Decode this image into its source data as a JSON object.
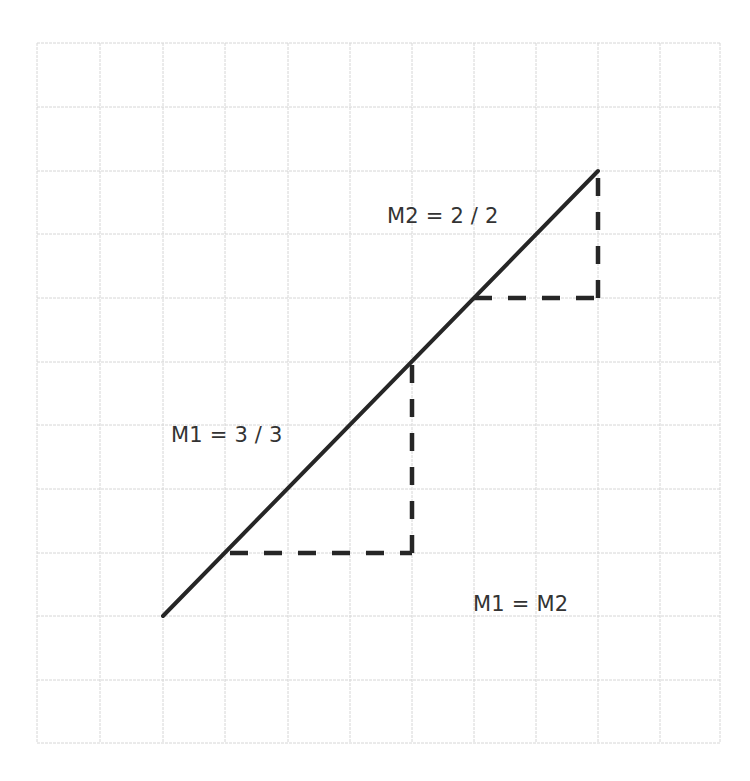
{
  "diagram": {
    "grid": {
      "columns": 11,
      "rows": 11,
      "x_lines": [
        37,
        100,
        163,
        225,
        288,
        350,
        412,
        474,
        536,
        598,
        660,
        720
      ],
      "y_lines": [
        43,
        107,
        171,
        234,
        298,
        362,
        425,
        489,
        553,
        616,
        680,
        743
      ],
      "color": "#d6d6d6"
    },
    "line": {
      "start": {
        "x": 163,
        "y": 616
      },
      "end": {
        "x": 598,
        "y": 171
      },
      "color": "#262626"
    },
    "triangles": [
      {
        "name": "M1",
        "rise": 3,
        "run": 3,
        "horizontal": {
          "x1": 230,
          "y": 553,
          "x2": 412
        },
        "vertical": {
          "x": 412,
          "y1": 553,
          "y2": 362
        }
      },
      {
        "name": "M2",
        "rise": 2,
        "run": 2,
        "horizontal": {
          "x1": 474,
          "y": 298,
          "x2": 598
        },
        "vertical": {
          "x": 598,
          "y1": 298,
          "y2": 171
        }
      }
    ],
    "labels": {
      "m1": "M1 = 3 / 3",
      "m2": "M2 = 2 / 2",
      "equality": "M1 = M2"
    }
  }
}
